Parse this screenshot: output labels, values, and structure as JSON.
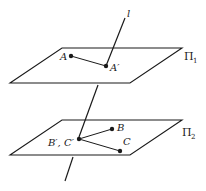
{
  "diagram": {
    "line": {
      "label": "l"
    },
    "plane1": {
      "label": "Π",
      "subscript": "1",
      "points": [
        {
          "name": "A"
        },
        {
          "name": "A′"
        }
      ]
    },
    "plane2": {
      "label": "Π",
      "subscript": "2",
      "points": [
        {
          "name": "B"
        },
        {
          "name": "C"
        },
        {
          "name": "B′, C′"
        }
      ]
    }
  },
  "colors": {
    "stroke": "#1a1a1a",
    "background": "#ffffff"
  }
}
